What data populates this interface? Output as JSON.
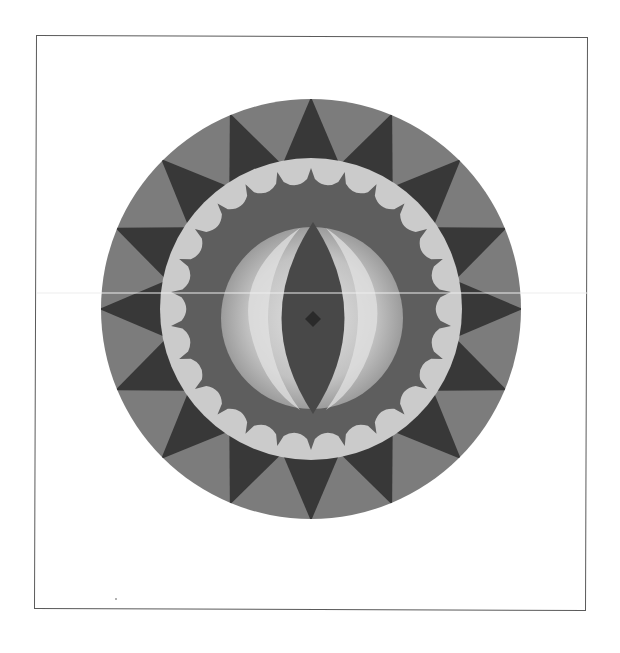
{
  "artwork": {
    "title": "Circular painted shield with eye motif",
    "colors": {
      "background": "#ffffff",
      "frame": "#5a5a5a",
      "star_dark": "#383838",
      "star_mid": "#7c7c7c",
      "light_ring": "#cbcbcb",
      "scallop_band": "#5e5e5e",
      "crescent_light": "#c4c4c4",
      "crescent_highlight": "#e6e6e6",
      "vesica_dark": "#484848",
      "center_diamond": "#2a2a2a",
      "scan_line": "#eeeeee"
    },
    "geometry": {
      "center": [
        311,
        309
      ],
      "outer_radius": 210,
      "light_ring_radius": 151,
      "scallop_inner_radius": 120,
      "crescent_radius": 90,
      "star_points": 16
    }
  }
}
